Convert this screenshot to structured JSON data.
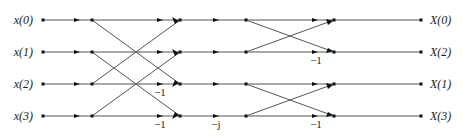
{
  "rows_y": [
    20,
    52,
    84,
    116
  ],
  "columns_x": {
    "input": 43,
    "stage1_in": 92,
    "stage1_out": 180,
    "stage2_in": 246,
    "stage2_out": 334,
    "output": 421
  },
  "inputs": [
    "x(0)",
    "x(1)",
    "x(2)",
    "x(3)"
  ],
  "outputs": [
    "X(0)",
    "X(2)",
    "X(1)",
    "X(3)"
  ],
  "weights": {
    "stage1_row2": "−1",
    "stage1_row3": "−1",
    "twiddle_row3": "−j",
    "stage2_row1": "−1",
    "stage2_row3": "−1"
  }
}
